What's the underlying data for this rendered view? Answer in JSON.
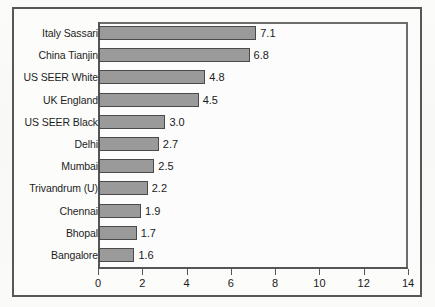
{
  "chart_data": {
    "type": "bar",
    "orientation": "horizontal",
    "title": "",
    "subtitle": "",
    "xlabel": "",
    "ylabel": "",
    "xlim": [
      0,
      14
    ],
    "xticks": [
      0,
      2,
      4,
      6,
      8,
      10,
      12,
      14
    ],
    "xtick_labels": [
      "0",
      "2",
      "4",
      "6",
      "8",
      "10",
      "12",
      "14"
    ],
    "grid": false,
    "legend": null,
    "categories": [
      "Italy Sassari",
      "China Tianjin",
      "US SEER White",
      "UK England",
      "US SEER Black",
      "Delhi",
      "Mumbai",
      "Trivandrum (U)",
      "Chennai",
      "Bhopal",
      "Bangalore"
    ],
    "values": [
      7.1,
      6.8,
      4.8,
      4.5,
      3.0,
      2.7,
      2.5,
      2.2,
      1.9,
      1.7,
      1.6
    ],
    "value_labels": [
      "7.1",
      "6.8",
      "4.8",
      "4.5",
      "3.0",
      "2.7",
      "2.5",
      "2.2",
      "1.9",
      "1.7",
      "1.6"
    ],
    "bar_color": "#9a9a9a",
    "bar_border_color": "#4a4a4a",
    "plot_background": "#fcfcfc",
    "axis_color": "#555555",
    "text_color": "#1a1a1a"
  }
}
